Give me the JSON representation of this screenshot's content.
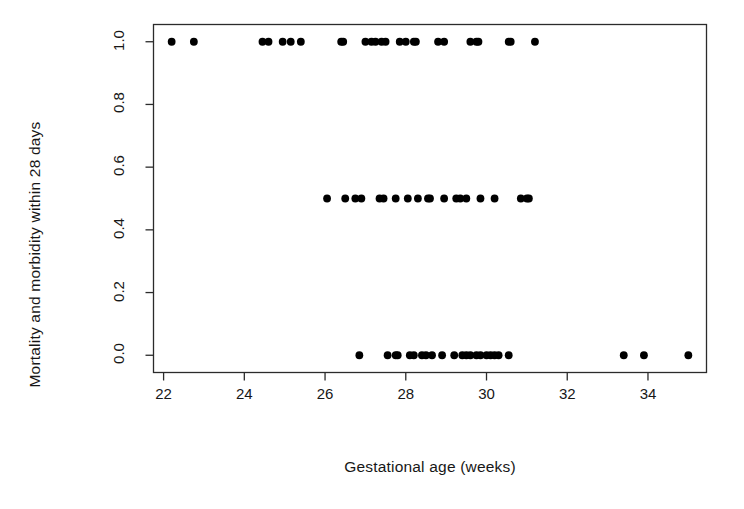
{
  "chart_data": {
    "type": "scatter",
    "title": "",
    "xlabel": "Gestational age (weeks)",
    "ylabel": "Mortality and morbidity within 28 days",
    "xlim": [
      21.75,
      35.45
    ],
    "ylim": [
      -0.055,
      1.055
    ],
    "xticks": [
      22,
      24,
      26,
      28,
      30,
      32,
      34
    ],
    "xtick_labels": [
      "22",
      "24",
      "26",
      "28",
      "30",
      "32",
      "34"
    ],
    "yticks": [
      0.0,
      0.2,
      0.4,
      0.6,
      0.8,
      1.0
    ],
    "ytick_labels": [
      "0.0",
      "0.2",
      "0.4",
      "0.6",
      "0.8",
      "1.0"
    ],
    "grid": false,
    "legend": null,
    "marker": "filled-circle",
    "marker_color": "#000000",
    "marker_size_px": 4.6,
    "box_frame": true,
    "series": [
      {
        "name": "Outcome by gestational age",
        "x": [
          22.2,
          22.75,
          24.45,
          24.6,
          24.95,
          25.15,
          25.4,
          26.4,
          26.45,
          27.0,
          27.15,
          27.25,
          27.4,
          27.5,
          27.85,
          28.0,
          28.2,
          28.25,
          28.8,
          28.95,
          29.6,
          29.75,
          29.8,
          30.55,
          30.6,
          31.2
        ],
        "y": [
          1,
          1,
          1,
          1,
          1,
          1,
          1,
          1,
          1,
          1,
          1,
          1,
          1,
          1,
          1,
          1,
          1,
          1,
          1,
          1,
          1,
          1,
          1,
          1,
          1,
          1
        ]
      },
      {
        "name": "Outcome by gestational age (intermediate)",
        "x": [
          26.05,
          26.5,
          26.75,
          26.9,
          27.35,
          27.45,
          27.75,
          28.05,
          28.3,
          28.55,
          28.6,
          28.95,
          29.25,
          29.35,
          29.5,
          29.85,
          30.2,
          30.85,
          31.0,
          31.05
        ],
        "y": [
          0.5,
          0.5,
          0.5,
          0.5,
          0.5,
          0.5,
          0.5,
          0.5,
          0.5,
          0.5,
          0.5,
          0.5,
          0.5,
          0.5,
          0.5,
          0.5,
          0.5,
          0.5,
          0.5,
          0.5
        ]
      },
      {
        "name": "Outcome by gestational age (survived)",
        "x": [
          26.85,
          27.55,
          27.75,
          27.8,
          28.1,
          28.2,
          28.4,
          28.5,
          28.65,
          28.9,
          29.2,
          29.4,
          29.5,
          29.6,
          29.75,
          29.85,
          30.0,
          30.1,
          30.2,
          30.3,
          30.55,
          33.4,
          33.9,
          35.0
        ],
        "y": [
          0,
          0,
          0,
          0,
          0,
          0,
          0,
          0,
          0,
          0,
          0,
          0,
          0,
          0,
          0,
          0,
          0,
          0,
          0,
          0,
          0,
          0,
          0,
          0
        ]
      }
    ]
  },
  "axes": {
    "x_axis_label": "Gestational age (weeks)",
    "y_axis_label": "Mortality and morbidity within 28 days"
  }
}
